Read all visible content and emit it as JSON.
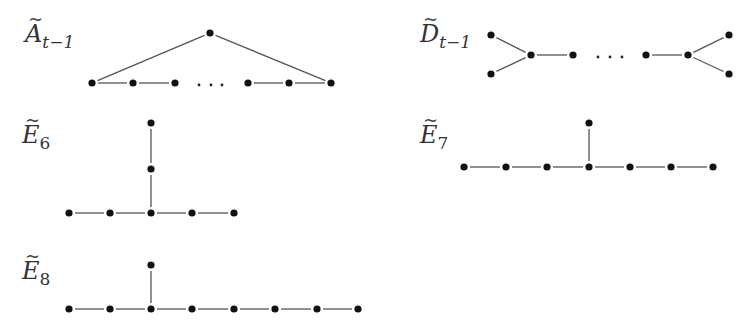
{
  "figure": {
    "diagrams": [
      {
        "id": "A",
        "label": {
          "base": "A",
          "tilde": "~",
          "sub": "t−1",
          "x": 25,
          "y": 22
        },
        "nodes": [
          [
            210,
            33
          ],
          [
            92,
            83
          ],
          [
            133,
            83
          ],
          [
            175,
            83
          ],
          [
            248,
            83
          ],
          [
            289,
            83
          ],
          [
            331,
            83
          ]
        ],
        "edges": [
          [
            0,
            1
          ],
          [
            0,
            6
          ],
          [
            1,
            2
          ],
          [
            2,
            3
          ],
          [
            4,
            5
          ],
          [
            5,
            6
          ]
        ],
        "ellipsis": [
          [
            199,
            85
          ],
          [
            211,
            85
          ],
          [
            222,
            85
          ]
        ]
      },
      {
        "id": "D",
        "label": {
          "base": "D",
          "tilde": "~",
          "sub": "t−1",
          "x": 420,
          "y": 22
        },
        "nodes": [
          [
            491,
            35
          ],
          [
            491,
            74
          ],
          [
            531,
            55
          ],
          [
            573,
            55
          ],
          [
            646,
            55
          ],
          [
            688,
            55
          ],
          [
            729,
            35
          ],
          [
            729,
            74
          ]
        ],
        "edges": [
          [
            0,
            2
          ],
          [
            1,
            2
          ],
          [
            2,
            3
          ],
          [
            4,
            5
          ],
          [
            5,
            6
          ],
          [
            5,
            7
          ]
        ],
        "ellipsis": [
          [
            598,
            57
          ],
          [
            610,
            57
          ],
          [
            622,
            57
          ]
        ]
      },
      {
        "id": "E6",
        "label": {
          "base": "E",
          "tilde": "~",
          "sub": "6",
          "x": 22,
          "y": 123
        },
        "nodes": [
          [
            151,
            123
          ],
          [
            151,
            169
          ],
          [
            69,
            213
          ],
          [
            110,
            213
          ],
          [
            151,
            213
          ],
          [
            192,
            213
          ],
          [
            234,
            213
          ]
        ],
        "edges": [
          [
            0,
            1
          ],
          [
            1,
            4
          ],
          [
            2,
            3
          ],
          [
            3,
            4
          ],
          [
            4,
            5
          ],
          [
            5,
            6
          ]
        ],
        "ellipsis": []
      },
      {
        "id": "E7",
        "label": {
          "base": "E",
          "tilde": "~",
          "sub": "7",
          "x": 420,
          "y": 123
        },
        "nodes": [
          [
            589,
            123
          ],
          [
            464,
            167
          ],
          [
            506,
            167
          ],
          [
            547,
            167
          ],
          [
            589,
            167
          ],
          [
            630,
            167
          ],
          [
            671,
            167
          ],
          [
            713,
            167
          ]
        ],
        "edges": [
          [
            0,
            4
          ],
          [
            1,
            2
          ],
          [
            2,
            3
          ],
          [
            3,
            4
          ],
          [
            4,
            5
          ],
          [
            5,
            6
          ],
          [
            6,
            7
          ]
        ],
        "ellipsis": []
      },
      {
        "id": "E8",
        "label": {
          "base": "E",
          "tilde": "~",
          "sub": "8",
          "x": 22,
          "y": 259
        },
        "nodes": [
          [
            151,
            265
          ],
          [
            69,
            309
          ],
          [
            110,
            309
          ],
          [
            151,
            309
          ],
          [
            192,
            309
          ],
          [
            234,
            309
          ],
          [
            275,
            309
          ],
          [
            317,
            309
          ],
          [
            358,
            309
          ]
        ],
        "edges": [
          [
            0,
            3
          ],
          [
            1,
            2
          ],
          [
            2,
            3
          ],
          [
            3,
            4
          ],
          [
            4,
            5
          ],
          [
            5,
            6
          ],
          [
            6,
            7
          ],
          [
            7,
            8
          ]
        ],
        "ellipsis": []
      }
    ]
  },
  "style": {
    "node_color": "#111111",
    "edge_color": "#555555",
    "node_radius": 3.6,
    "edge_gap": 6
  }
}
